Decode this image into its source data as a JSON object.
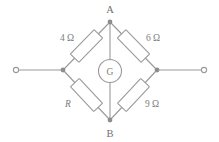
{
  "figure": {
    "name": "wheatstone-bridge-circuit",
    "background_color": "#ffffff",
    "line_color": "#9a9a9a",
    "text_color": "#7d7d7d",
    "node_color": "#8d8d8d"
  },
  "nodes": {
    "top": {
      "label": "A",
      "name": "node-a"
    },
    "bottom": {
      "label": "B",
      "name": "node-b"
    },
    "left": {
      "label": "",
      "name": "node-left"
    },
    "right": {
      "label": "",
      "name": "node-right"
    }
  },
  "meter": {
    "label": "G",
    "name": "galvanometer"
  },
  "resistors": {
    "top_left": {
      "label": "4 Ω",
      "name": "resistor-4-ohm"
    },
    "top_right": {
      "label": "6 Ω",
      "name": "resistor-6-ohm"
    },
    "bottom_left": {
      "label": "R",
      "name": "resistor-r",
      "italic": true
    },
    "bottom_right": {
      "label": "9 Ω",
      "name": "resistor-9-ohm"
    }
  },
  "terminals": {
    "left": {
      "name": "terminal-left"
    },
    "right": {
      "name": "terminal-right"
    }
  }
}
